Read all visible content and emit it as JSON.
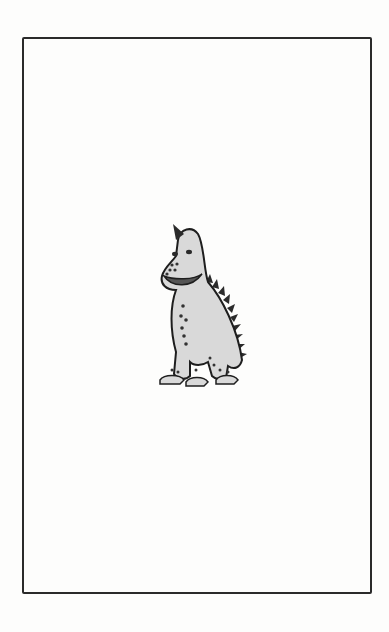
{
  "page": {
    "illustration": {
      "subject": "cartoon dinosaur with horn, spotted body and spiked back",
      "icon": "dinosaur-illustration",
      "colors": {
        "body_fill": "#d9d9d9",
        "outline": "#1e1e1e",
        "spots": "#3a3a3a",
        "frame": "#2a2a2a",
        "paper": "#fdfdfc"
      }
    }
  }
}
